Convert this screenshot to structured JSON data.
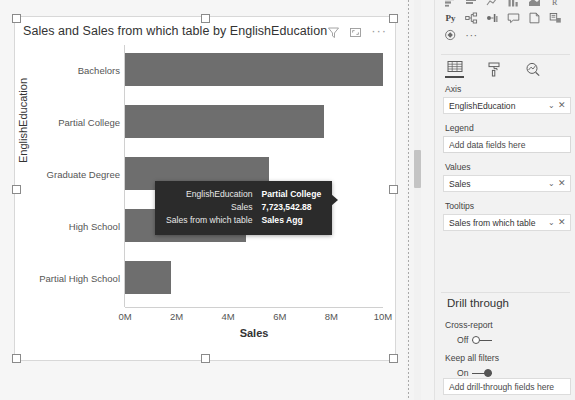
{
  "visual": {
    "title": "Sales and Sales from which table by EnglishEducation",
    "header_icons": [
      "filter-icon",
      "focus-mode-icon",
      "more-options-icon"
    ]
  },
  "chart_data": {
    "type": "bar",
    "orientation": "horizontal",
    "title": "Sales and Sales from which table by EnglishEducation",
    "categories": [
      "Bachelors",
      "Partial College",
      "Graduate Degree",
      "High School",
      "Partial High School"
    ],
    "values": [
      10000000,
      7723542.88,
      5600000,
      4700000,
      1800000
    ],
    "series": [
      {
        "name": "Sales",
        "values": [
          10000000,
          7723542.88,
          5600000,
          4700000,
          1800000
        ]
      }
    ],
    "xlabel": "Sales",
    "ylabel": "EnglishEducation",
    "xlim": [
      0,
      10000000
    ],
    "xticks": [
      "0M",
      "2M",
      "4M",
      "6M",
      "8M",
      "10M"
    ],
    "xtick_values": [
      0,
      2000000,
      4000000,
      6000000,
      8000000,
      10000000
    ],
    "grid": false,
    "legend": "none",
    "bar_color": "#6e6e6e"
  },
  "tooltip": {
    "rows": [
      {
        "key": "EnglishEducation",
        "value": "Partial College"
      },
      {
        "key": "Sales",
        "value": "7,723,542.88"
      },
      {
        "key": "Sales from which table",
        "value": "Sales Agg"
      }
    ]
  },
  "pane": {
    "gallery_row3": [
      "python-visual-icon",
      "decomposition-tree-icon",
      "key-influencers-icon",
      "qna-icon",
      "paginated-report-icon",
      "smart-narrative-icon"
    ],
    "gallery_row4": [
      "power-apps-icon",
      "more-visuals-icon"
    ],
    "python_label": "Py",
    "more_dots": "···",
    "tabs": [
      "fields-tab",
      "format-tab",
      "analytics-tab"
    ],
    "wells": [
      {
        "label": "Axis",
        "value": "EnglishEducation",
        "placeholder": false
      },
      {
        "label": "Legend",
        "value": "Add data fields here",
        "placeholder": true
      },
      {
        "label": "Values",
        "value": "Sales",
        "placeholder": false
      },
      {
        "label": "Tooltips",
        "value": "Sales from which table",
        "placeholder": false
      }
    ],
    "drill": {
      "title": "Drill through",
      "cross_report_label": "Cross-report",
      "cross_report_state": "Off",
      "keep_filters_label": "Keep all filters",
      "keep_filters_state": "On",
      "drop_placeholder": "Add drill-through fields here"
    }
  }
}
